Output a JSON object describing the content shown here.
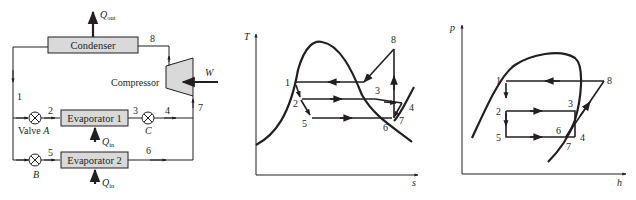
{
  "schematic": {
    "components": {
      "condenser": "Condenser",
      "compressor": "Compressor",
      "evaporator1": "Evaporator 1",
      "evaporator2": "Evaporator 2"
    },
    "valves": {
      "valve_a_prefix": "Valve ",
      "valve_a": "A",
      "valve_b": "B",
      "valve_c": "C"
    },
    "heat": {
      "q_out_main": "Q",
      "q_out_sub": "out",
      "q_in_main": "Q",
      "q_in_sub": "in",
      "work": "W"
    },
    "states": [
      "1",
      "2",
      "3",
      "4",
      "5",
      "6",
      "7",
      "8"
    ]
  },
  "ts_diagram": {
    "y_axis": "T",
    "x_axis": "s",
    "states": [
      "1",
      "2",
      "3",
      "4",
      "5",
      "6",
      "7",
      "8"
    ]
  },
  "ph_diagram": {
    "y_axis": "p",
    "x_axis": "h",
    "states": [
      "1",
      "2",
      "3",
      "4",
      "5",
      "6",
      "7",
      "8"
    ]
  }
}
